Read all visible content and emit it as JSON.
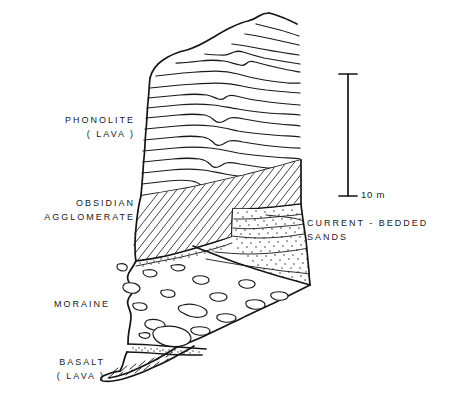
{
  "figure": {
    "type": "geological-cross-section",
    "background_color": "#ffffff",
    "ink_color": "#151515",
    "width": 455,
    "height": 399
  },
  "labels": {
    "phonolite": {
      "line1": "PHONOLITE",
      "line2": "( LAVA )",
      "align": "right",
      "x": 135,
      "y": 113
    },
    "obsidian": {
      "line1": "OBSIDIAN",
      "line2": "AGGLOMERATE",
      "align": "right",
      "x": 135,
      "y": 196
    },
    "moraine": {
      "line1": "MORAINE",
      "line2": "",
      "align": "right",
      "x": 110,
      "y": 297
    },
    "basalt": {
      "line1": "BASALT",
      "line2": "( LAVA )",
      "align": "right",
      "x": 105,
      "y": 355
    },
    "sands": {
      "line1": "CURRENT - BEDDED",
      "line2": "SANDS",
      "align": "left",
      "x": 307,
      "y": 216
    }
  },
  "scale_bar": {
    "label": "10 m",
    "value": 10,
    "unit": "m",
    "x": 348,
    "top_y": 74,
    "bottom_y": 196,
    "tick_half_width": 9,
    "label_x": 360,
    "label_y": 190
  },
  "units": [
    {
      "name": "PHONOLITE (LAVA)",
      "pattern": "wavy-flow-banding"
    },
    {
      "name": "OBSIDIAN AGGLOMERATE",
      "pattern": "diagonal-hatch"
    },
    {
      "name": "CURRENT - BEDDED SANDS",
      "pattern": "stipple-with-cross-beds"
    },
    {
      "name": "MORAINE",
      "pattern": "scattered-clasts"
    },
    {
      "name": "BASALT (LAVA)",
      "pattern": "short-dashes"
    }
  ]
}
